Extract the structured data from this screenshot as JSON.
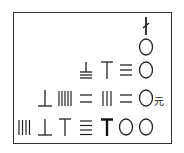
{
  "unit_label": "元",
  "rows": [
    {
      "row": 1,
      "glyphs": [
        "negative-one"
      ]
    },
    {
      "row": 2,
      "glyphs": [
        "zero"
      ]
    },
    {
      "row": 3,
      "glyphs": [
        "eight-horizontal",
        "six-vertical",
        "three-horizontal",
        "zero"
      ]
    },
    {
      "row": 4,
      "glyphs": [
        "six-horizontal",
        "five-vertical",
        "two-horizontal",
        "three-vertical",
        "two-horizontal",
        "zero"
      ],
      "unit": "元"
    },
    {
      "row": 5,
      "glyphs": [
        "four-vertical",
        "six-horizontal",
        "six-vertical",
        "four-horizontal",
        "six-vertical-bold",
        "zero",
        "zero"
      ]
    }
  ]
}
